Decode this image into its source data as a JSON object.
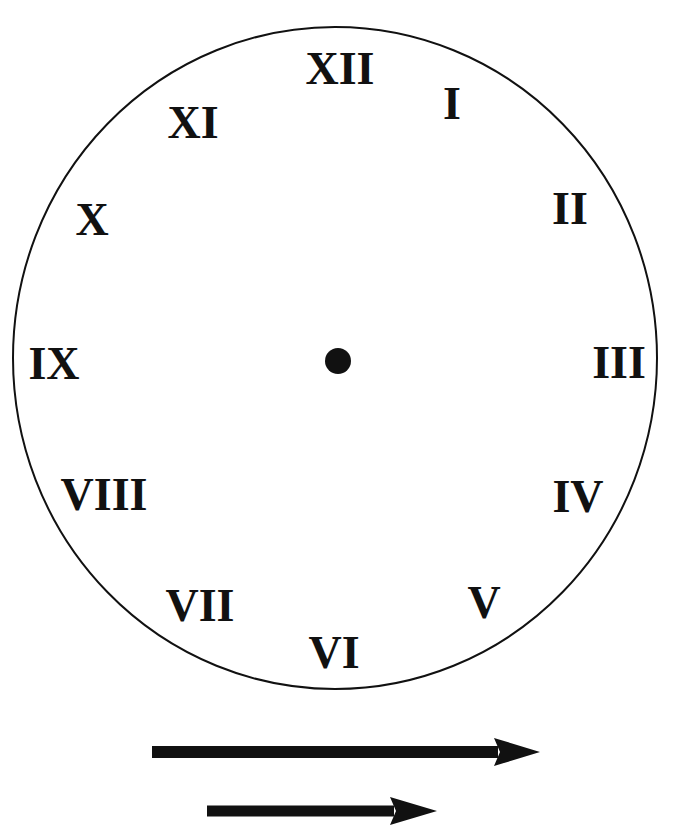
{
  "diagram": {
    "type": "clock-face",
    "colors": {
      "background": "#ffffff",
      "ink": "#111111"
    },
    "face": {
      "cx": 335,
      "cy": 358,
      "rx": 322,
      "ry": 331,
      "stroke_width": 2
    },
    "center_dot": {
      "cx": 338,
      "cy": 361,
      "r": 13
    },
    "numerals": [
      {
        "label": "XII",
        "x": 340,
        "y": 68
      },
      {
        "label": "I",
        "x": 452,
        "y": 103
      },
      {
        "label": "II",
        "x": 570,
        "y": 208
      },
      {
        "label": "III",
        "x": 619,
        "y": 362
      },
      {
        "label": "IV",
        "x": 578,
        "y": 496
      },
      {
        "label": "V",
        "x": 484,
        "y": 602
      },
      {
        "label": "VI",
        "x": 334,
        "y": 652
      },
      {
        "label": "VII",
        "x": 200,
        "y": 605
      },
      {
        "label": "VIII",
        "x": 104,
        "y": 494
      },
      {
        "label": "IX",
        "x": 54,
        "y": 363
      },
      {
        "label": "X",
        "x": 92,
        "y": 219
      },
      {
        "label": "XI",
        "x": 193,
        "y": 122
      }
    ],
    "hands": [
      {
        "name": "minute-hand",
        "shaft": {
          "x1": 152,
          "x2": 498,
          "y": 752,
          "thickness": 12
        },
        "head": {
          "base_x": 494,
          "tip_x": 540,
          "half_height": 14
        }
      },
      {
        "name": "hour-hand",
        "shaft": {
          "x1": 207,
          "x2": 394,
          "y": 811,
          "thickness": 11
        },
        "head": {
          "base_x": 390,
          "tip_x": 437,
          "half_height": 14
        }
      }
    ]
  }
}
